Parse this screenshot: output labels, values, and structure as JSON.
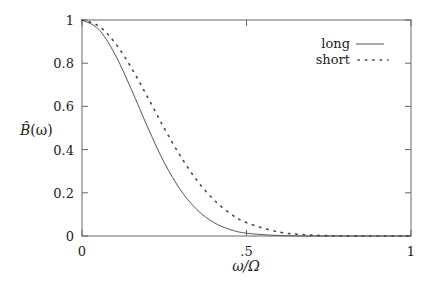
{
  "chart_data": {
    "type": "line",
    "title": "",
    "xlabel": "ω/Ω",
    "ylabel": "B̂(ω)",
    "xlim": [
      0,
      1
    ],
    "ylim": [
      0,
      1
    ],
    "grid": false,
    "legend_position": "upper right",
    "x_ticks": [
      {
        "value": 0,
        "label": "0"
      },
      {
        "value": 0.5,
        "label": ".5"
      },
      {
        "value": 1,
        "label": "1"
      }
    ],
    "y_ticks": [
      {
        "value": 0,
        "label": "0"
      },
      {
        "value": 0.2,
        "label": "0.2"
      },
      {
        "value": 0.4,
        "label": "0.4"
      },
      {
        "value": 0.6,
        "label": "0.6"
      },
      {
        "value": 0.8,
        "label": "0.8"
      },
      {
        "value": 1,
        "label": "1"
      }
    ],
    "x": [
      0,
      0.05,
      0.1,
      0.15,
      0.2,
      0.25,
      0.3,
      0.35,
      0.4,
      0.45,
      0.5,
      0.6,
      0.7,
      0.8,
      0.9,
      1.0
    ],
    "series": [
      {
        "name": "long",
        "style": "solid",
        "values": [
          1.0,
          0.958,
          0.842,
          0.679,
          0.502,
          0.34,
          0.212,
          0.121,
          0.063,
          0.03,
          0.013,
          0.002,
          0.0,
          0.0,
          0.0,
          0.0
        ]
      },
      {
        "name": "short",
        "style": "dotted",
        "values": [
          1.0,
          0.973,
          0.895,
          0.779,
          0.641,
          0.499,
          0.368,
          0.256,
          0.169,
          0.105,
          0.062,
          0.018,
          0.004,
          0.001,
          0.0,
          0.0
        ]
      }
    ]
  },
  "legend": {
    "items": [
      {
        "label": "long"
      },
      {
        "label": "short"
      }
    ]
  },
  "axes": {
    "xlabel": "ω/Ω",
    "ylabel_main": "B̂",
    "ylabel_arg": "(ω)"
  },
  "colors": {
    "line": "#555555",
    "axis": "#666666",
    "text": "#222222"
  }
}
